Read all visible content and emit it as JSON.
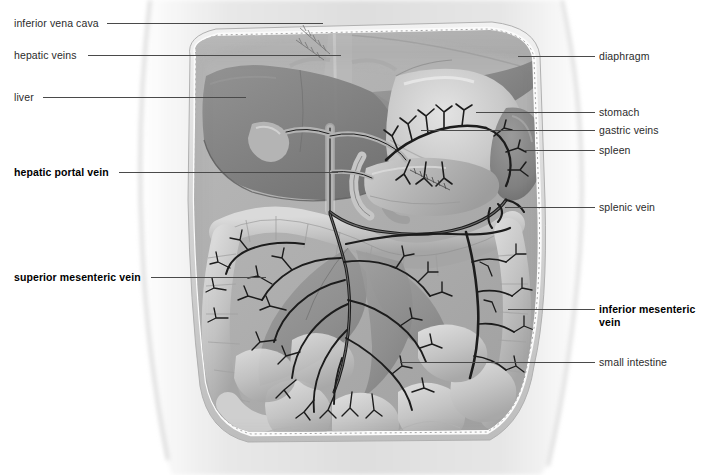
{
  "figure": {
    "view": "anterior",
    "style": "grayscale-medical-illustration"
  },
  "colors": {
    "label_text": "#2b2b2b",
    "label_text_bold": "#000000",
    "leader_line": "#4a4a4a",
    "background": "#ffffff",
    "vessel_dark": "#1c1c1c",
    "organ_mid": "#9a9a9a",
    "organ_light": "#c8c8c8",
    "organ_dark": "#6f6f6f",
    "body_wall": "#d8d8d8"
  },
  "labels_left": [
    {
      "id": "inferior-vena-cava",
      "text": "inferior vena cava",
      "bold": false,
      "text_x": 14,
      "text_y": 17,
      "leader_x": 107,
      "leader_y": 23,
      "leader_w": 216
    },
    {
      "id": "hepatic-veins",
      "text": "hepatic veins",
      "bold": false,
      "text_x": 14,
      "text_y": 49,
      "leader_x": 88,
      "leader_y": 55,
      "leader_w": 253
    },
    {
      "id": "liver",
      "text": "liver",
      "bold": false,
      "text_x": 14,
      "text_y": 91,
      "leader_x": 43,
      "leader_y": 97,
      "leader_w": 203
    },
    {
      "id": "hepatic-portal-vein",
      "text": "hepatic portal vein",
      "bold": true,
      "text_x": 14,
      "text_y": 166,
      "leader_x": 119,
      "leader_y": 172,
      "leader_w": 219
    },
    {
      "id": "superior-mesenteric-vein",
      "text": "superior mesenteric vein",
      "bold": true,
      "text_x": 14,
      "text_y": 271,
      "leader_x": 151,
      "leader_y": 277,
      "leader_w": 115
    }
  ],
  "labels_right": [
    {
      "id": "diaphragm",
      "text": "diaphragm",
      "bold": false,
      "text_x": 599,
      "text_y": 50,
      "leader_x": 518,
      "leader_y": 56,
      "leader_w": 77
    },
    {
      "id": "stomach",
      "text": "stomach",
      "bold": false,
      "text_x": 599,
      "text_y": 106,
      "leader_x": 476,
      "leader_y": 112,
      "leader_w": 119
    },
    {
      "id": "gastric-veins",
      "text": "gastric veins",
      "bold": false,
      "text_x": 599,
      "text_y": 124,
      "leader_x": 421,
      "leader_y": 130,
      "leader_w": 174
    },
    {
      "id": "spleen",
      "text": "spleen",
      "bold": false,
      "text_x": 599,
      "text_y": 144,
      "leader_x": 524,
      "leader_y": 150,
      "leader_w": 71
    },
    {
      "id": "splenic-vein",
      "text": "splenic vein",
      "bold": false,
      "text_x": 599,
      "text_y": 201,
      "leader_x": 505,
      "leader_y": 207,
      "leader_w": 90
    },
    {
      "id": "inferior-mesenteric-vein",
      "text": "inferior mesenteric vein",
      "bold": true,
      "text_x": 599,
      "text_y": 303,
      "leader_x": 508,
      "leader_y": 309,
      "leader_w": 87
    },
    {
      "id": "small-intestine",
      "text": "small intestine",
      "bold": false,
      "text_x": 599,
      "text_y": 356,
      "leader_x": 400,
      "leader_y": 362,
      "leader_w": 195
    }
  ],
  "structures": [
    "inferior vena cava",
    "hepatic veins",
    "liver",
    "hepatic portal vein",
    "superior mesenteric vein",
    "diaphragm",
    "stomach",
    "gastric veins",
    "spleen",
    "splenic vein",
    "inferior mesenteric vein",
    "small intestine"
  ]
}
